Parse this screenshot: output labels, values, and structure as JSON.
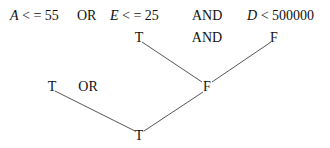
{
  "expression": {
    "term1": {
      "var": "A",
      "op": " < = ",
      "value": "55"
    },
    "op1": "OR",
    "term2": {
      "var": "E",
      "op": " < = ",
      "value": "25"
    },
    "op2": "AND",
    "term3": {
      "var": "D",
      "op": " < ",
      "value": "500000"
    }
  },
  "tree": {
    "upper_left": "T",
    "upper_op": "AND",
    "upper_right": "F",
    "middle_left": "T",
    "middle_op": "OR",
    "middle_right": "F",
    "root": "T"
  },
  "colors": {
    "line": "#555555",
    "text": "#111111"
  }
}
